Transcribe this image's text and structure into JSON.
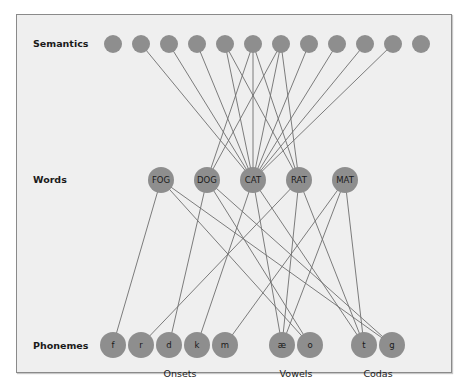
{
  "rows": {
    "semantics": {
      "label": "Semantics"
    },
    "words": {
      "label": "Words"
    },
    "phonemes": {
      "label": "Phonemes"
    }
  },
  "groups": {
    "onsets": "Onsets",
    "vowels": "Vowels",
    "codas": "Codas"
  },
  "colors": {
    "background": "#efefef",
    "node": "#8e8e8e",
    "edge": "#6e6e6e",
    "text": "#1a1a1a"
  },
  "semantic_nodes": [
    {
      "id": "s1",
      "x": 113
    },
    {
      "id": "s2",
      "x": 141
    },
    {
      "id": "s3",
      "x": 169
    },
    {
      "id": "s4",
      "x": 197
    },
    {
      "id": "s5",
      "x": 225
    },
    {
      "id": "s6",
      "x": 253
    },
    {
      "id": "s7",
      "x": 281
    },
    {
      "id": "s8",
      "x": 309
    },
    {
      "id": "s9",
      "x": 337
    },
    {
      "id": "s10",
      "x": 365
    },
    {
      "id": "s11",
      "x": 393
    },
    {
      "id": "s12",
      "x": 421
    }
  ],
  "word_nodes": [
    {
      "id": "FOG",
      "label": "FOG",
      "x": 161
    },
    {
      "id": "DOG",
      "label": "DOG",
      "x": 207
    },
    {
      "id": "CAT",
      "label": "CAT",
      "x": 253
    },
    {
      "id": "RAT",
      "label": "RAT",
      "x": 299
    },
    {
      "id": "MAT",
      "label": "MAT",
      "x": 345
    }
  ],
  "phoneme_nodes": [
    {
      "id": "f",
      "label": "f",
      "x": 113
    },
    {
      "id": "r",
      "label": "r",
      "x": 141
    },
    {
      "id": "d",
      "label": "d",
      "x": 169
    },
    {
      "id": "k",
      "label": "k",
      "x": 197
    },
    {
      "id": "m",
      "label": "m",
      "x": 225
    },
    {
      "id": "ae",
      "label": "æ",
      "x": 282
    },
    {
      "id": "o",
      "label": "o",
      "x": 310
    },
    {
      "id": "t",
      "label": "t",
      "x": 364
    },
    {
      "id": "g",
      "label": "g",
      "x": 392
    }
  ],
  "semantic_word_edges": [
    [
      "s2",
      "CAT"
    ],
    [
      "s3",
      "CAT"
    ],
    [
      "s4",
      "CAT"
    ],
    [
      "s5",
      "CAT"
    ],
    [
      "s5",
      "RAT"
    ],
    [
      "s6",
      "DOG"
    ],
    [
      "s6",
      "CAT"
    ],
    [
      "s6",
      "RAT"
    ],
    [
      "s7",
      "DOG"
    ],
    [
      "s7",
      "CAT"
    ],
    [
      "s7",
      "RAT"
    ],
    [
      "s8",
      "CAT"
    ],
    [
      "s9",
      "CAT"
    ],
    [
      "s10",
      "CAT"
    ],
    [
      "s11",
      "CAT"
    ]
  ],
  "word_phoneme_edges": [
    [
      "FOG",
      "f"
    ],
    [
      "FOG",
      "o"
    ],
    [
      "FOG",
      "g"
    ],
    [
      "DOG",
      "d"
    ],
    [
      "DOG",
      "o"
    ],
    [
      "DOG",
      "g"
    ],
    [
      "CAT",
      "k"
    ],
    [
      "CAT",
      "ae"
    ],
    [
      "CAT",
      "t"
    ],
    [
      "RAT",
      "r"
    ],
    [
      "RAT",
      "ae"
    ],
    [
      "RAT",
      "t"
    ],
    [
      "MAT",
      "m"
    ],
    [
      "MAT",
      "ae"
    ],
    [
      "MAT",
      "t"
    ]
  ]
}
